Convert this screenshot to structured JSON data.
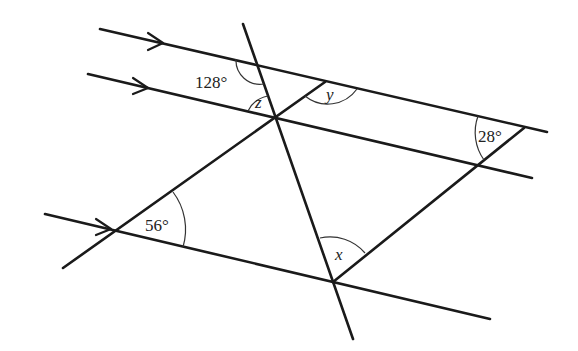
{
  "diagram": {
    "parallel_lines": [
      {
        "id": "line-1",
        "has_arrow": true
      },
      {
        "id": "line-2",
        "has_arrow": true
      },
      {
        "id": "line-3",
        "has_arrow": true
      }
    ],
    "angles": {
      "given_128": "128°",
      "given_28": "28°",
      "given_56": "56°",
      "unknown_x": "x",
      "unknown_y": "y",
      "unknown_z": "z"
    }
  }
}
